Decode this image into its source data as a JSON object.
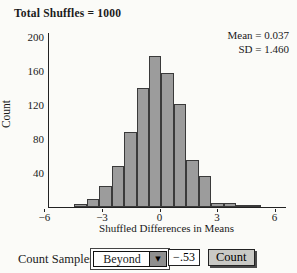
{
  "title": "Total Shuffles = 1000",
  "stats": {
    "mean_label": "Mean = 0.037",
    "sd_label": "SD = 1.460"
  },
  "chart_data": {
    "type": "bar",
    "subtype": "histogram",
    "title": "Total Shuffles = 1000",
    "xlabel": "Shuffled Differences in Means",
    "ylabel": "Count",
    "x_ticks": [
      -6,
      -3,
      0,
      3,
      6
    ],
    "y_ticks": [
      40,
      80,
      120,
      160,
      200
    ],
    "xlim": [
      -6.3,
      6.55
    ],
    "ylim": [
      0,
      205
    ],
    "grid": false,
    "bin_start": -4.5,
    "bin_width": 0.65,
    "counts": [
      4,
      10,
      25,
      48,
      88,
      140,
      178,
      158,
      121,
      55,
      37,
      5,
      5,
      2,
      1
    ],
    "total_shuffles": 1000,
    "mean": 0.037,
    "sd": 1.46,
    "bar_fill": "#9c9c9c",
    "bar_stroke": "#3a3a3a"
  },
  "controls": {
    "label": "Count Samples",
    "dropdown_value": "Beyond",
    "dropdown_arrow": "▼",
    "field_value": "−.53",
    "button_label": "Count"
  }
}
